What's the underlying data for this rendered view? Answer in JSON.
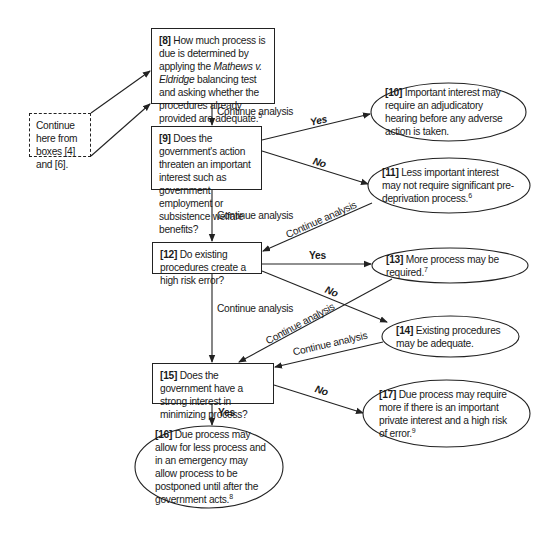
{
  "diagram": {
    "start_box": {
      "text": "Continue here from boxes [4] and [6]."
    },
    "boxes": [
      {
        "id": "8",
        "num": "[8]",
        "text_pre": "How much process is due is determined by applying the",
        "italic": "Mathews v. Eldridge",
        "text_post": "balancing test and asking whether the procedures already provided are adequate.",
        "footnote": "5",
        "shape": "rectangle"
      },
      {
        "id": "9",
        "num": "[9]",
        "text": "Does the government's action threaten an important interest such as government employment or subsistence welfare benefits?",
        "shape": "rectangle"
      },
      {
        "id": "10",
        "num": "[10]",
        "text": "Important interest may require an adjudicatory hearing before any adverse action is taken.",
        "shape": "ellipse"
      },
      {
        "id": "11",
        "num": "[11]",
        "text": "Less important interest may not require significant pre-deprivation process.",
        "footnote": "6",
        "shape": "ellipse"
      },
      {
        "id": "12",
        "num": "[12]",
        "text": "Do existing procedures create a high risk error?",
        "shape": "rectangle"
      },
      {
        "id": "13",
        "num": "[13]",
        "text": "More process may be required.",
        "footnote": "7",
        "shape": "ellipse"
      },
      {
        "id": "14",
        "num": "[14]",
        "text": "Existing procedures may be adequate.",
        "shape": "ellipse"
      },
      {
        "id": "15",
        "num": "[15]",
        "text": "Does the government have a strong interest in minimizing process?",
        "shape": "rectangle"
      },
      {
        "id": "16",
        "num": "[16]",
        "text": "Due process may allow for less process and in an emergency may allow process to be postponed until after the government acts.",
        "footnote": "8",
        "shape": "ellipse"
      },
      {
        "id": "17",
        "num": "[17]",
        "text": "Due process may require more if there is an important private interest and a high risk of error.",
        "footnote": "9",
        "shape": "ellipse"
      }
    ],
    "edge_labels": {
      "continue": "Continue analysis",
      "yes": "Yes",
      "no": "No"
    },
    "edges": [
      {
        "from": "start",
        "to": "8",
        "label": ""
      },
      {
        "from": "8",
        "to": "9",
        "label": "Continue analysis"
      },
      {
        "from": "9",
        "to": "10",
        "label": "Yes"
      },
      {
        "from": "9",
        "to": "11",
        "label": "No"
      },
      {
        "from": "9",
        "to": "12",
        "label": "Continue analysis"
      },
      {
        "from": "11",
        "to": "12",
        "label": "Continue analysis"
      },
      {
        "from": "12",
        "to": "13",
        "label": "Yes"
      },
      {
        "from": "12",
        "to": "14",
        "label": "No"
      },
      {
        "from": "12",
        "to": "15",
        "label": "Continue analysis"
      },
      {
        "from": "13",
        "to": "15",
        "label": "Continue analysis"
      },
      {
        "from": "14",
        "to": "15",
        "label": "Continue analysis"
      },
      {
        "from": "15",
        "to": "16",
        "label": "Yes"
      },
      {
        "from": "15",
        "to": "17",
        "label": "No"
      }
    ],
    "colors": {
      "line": "#222222",
      "background": "#ffffff",
      "text": "#1a1a1a"
    }
  }
}
